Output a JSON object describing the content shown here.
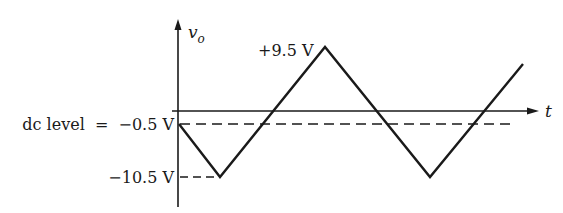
{
  "diagram": {
    "type": "triangular-waveform",
    "y_axis_label": "v",
    "y_axis_subscript": "o",
    "x_axis_label": "t",
    "labels": {
      "peak": "+9.5 V",
      "dc_level": "dc level  =  −0.5 V",
      "trough": "−10.5 V"
    },
    "values": {
      "peak_v": 9.5,
      "dc_level_v": -0.5,
      "trough_v": -10.5
    },
    "colors": {
      "stroke": "#1a1a1a",
      "background": "#ffffff"
    }
  }
}
